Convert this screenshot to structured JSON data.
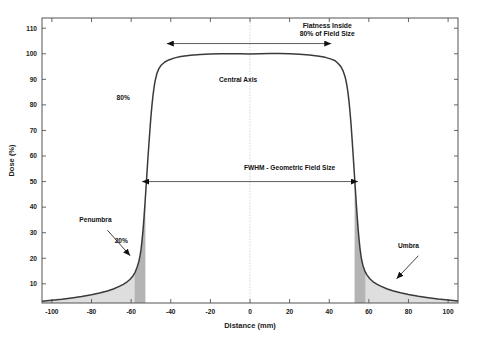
{
  "chart_data": {
    "type": "line",
    "title": "",
    "xlabel": "Distance (mm)",
    "ylabel": "Dose (%)",
    "xlim": [
      -105,
      105
    ],
    "ylim": [
      2.5,
      114
    ],
    "grid": false,
    "legend": null,
    "xticks": [
      -100,
      -80,
      -60,
      -40,
      -20,
      0,
      20,
      40,
      60,
      80,
      100
    ],
    "xtick_labels": [
      "-100",
      "-80",
      "-60",
      "-40",
      "-20",
      "0",
      "20",
      "40",
      "60",
      "80",
      "100"
    ],
    "yticks": [
      10,
      20,
      30,
      40,
      50,
      60,
      70,
      80,
      90,
      100,
      110
    ],
    "ytick_labels": [
      "10",
      "20",
      "30",
      "40",
      "50",
      "60",
      "70",
      "80",
      "90",
      "100",
      "110"
    ],
    "series": [
      {
        "name": "Beam profile",
        "color": "#3a3a3a",
        "x": [
          -105,
          -100,
          -95,
          -90,
          -85,
          -80,
          -76,
          -72,
          -69,
          -66,
          -64,
          -62,
          -60.5,
          -59,
          -58,
          -57,
          -56.2,
          -55.5,
          -55,
          -54.5,
          -54,
          -53.5,
          -53,
          -52.5,
          -52,
          -51.5,
          -51,
          -50.5,
          -50,
          -49.5,
          -49,
          -48.5,
          -48,
          -47,
          -46,
          -45,
          -43,
          -41,
          -38,
          -35,
          -30,
          -25,
          -20,
          -15,
          -10,
          -5,
          0,
          5,
          10,
          15,
          20,
          25,
          30,
          35,
          38,
          41,
          43,
          45,
          46,
          47,
          48,
          48.5,
          49,
          49.5,
          50,
          50.5,
          51,
          51.5,
          52,
          52.5,
          53,
          53.5,
          54,
          54.5,
          55,
          55.5,
          56.2,
          57,
          58,
          59,
          60.5,
          62,
          64,
          66,
          69,
          72,
          76,
          80,
          85,
          90,
          95,
          100,
          105
        ],
        "y": [
          3.2,
          3.6,
          4.0,
          4.5,
          5.0,
          5.7,
          6.4,
          7.2,
          8.0,
          9.0,
          9.8,
          10.8,
          11.8,
          13.2,
          14.5,
          16.5,
          18.5,
          21.0,
          23.5,
          27.0,
          31.0,
          36.0,
          41.5,
          47.5,
          53.5,
          59.5,
          65.0,
          70.5,
          75.5,
          79.8,
          83.5,
          86.5,
          89.0,
          92.3,
          94.2,
          95.4,
          96.8,
          97.6,
          98.4,
          98.9,
          99.4,
          99.7,
          99.9,
          100.0,
          100.0,
          100.0,
          99.9,
          100.0,
          100.1,
          100.1,
          100.0,
          99.8,
          99.5,
          99.0,
          98.6,
          97.9,
          97.3,
          95.8,
          94.8,
          93.3,
          91.0,
          89.3,
          87.2,
          84.5,
          81.2,
          77.2,
          72.5,
          67.0,
          61.2,
          55.2,
          49.2,
          43.2,
          37.5,
          32.3,
          27.8,
          24.0,
          20.0,
          17.2,
          15.0,
          13.5,
          12.0,
          10.9,
          9.9,
          9.1,
          8.1,
          7.3,
          6.5,
          5.8,
          5.1,
          4.6,
          4.1,
          3.7,
          3.3
        ]
      }
    ],
    "shaded_regions": [
      {
        "name": "penumbra-left",
        "label": "Penumbra",
        "x_start": -58.3,
        "x_end": -52.8,
        "color": "#b4b4b4"
      },
      {
        "name": "penumbra-right",
        "label": "Penumbra",
        "x_start": 52.8,
        "x_end": 58.3,
        "color": "#b4b4b4"
      },
      {
        "name": "umbra-left",
        "label": "Umbra",
        "x_start": -105,
        "x_end": -58.3,
        "color": "#dedede"
      },
      {
        "name": "umbra-right",
        "label": "Umbra",
        "x_start": 58.3,
        "x_end": 105,
        "color": "#dedede"
      }
    ],
    "annotations": [
      {
        "name": "flatness",
        "text_line1": "Flatness Inside",
        "text_line2": "80% of Field Size",
        "arrow": "double",
        "x_start": -42,
        "x_end": 41,
        "y": 104
      },
      {
        "name": "central-axis",
        "text": "Central Axis",
        "x": -6,
        "y": 89
      },
      {
        "name": "fwhm",
        "text": "FWHM - Geometric Field Size",
        "arrow": "double",
        "x_start": -54.5,
        "x_end": 54.5,
        "y": 50
      },
      {
        "name": "eighty-percent",
        "text": "80%",
        "x": -64,
        "y": 82
      },
      {
        "name": "twenty-percent",
        "text": "20%",
        "x": -65,
        "y": 26
      },
      {
        "name": "penumbra",
        "text": "Penumbra",
        "x": -78,
        "y": 34
      },
      {
        "name": "umbra",
        "text": "Umbra",
        "x": 80,
        "y": 24
      }
    ]
  },
  "colors": {
    "curve": "#3a3a3a",
    "axis": "#555555",
    "penumbra_fill": "#b4b4b4",
    "umbra_fill": "#dedede",
    "annotation": "#111111",
    "centerline": "#cccccc",
    "background": "#ffffff"
  }
}
